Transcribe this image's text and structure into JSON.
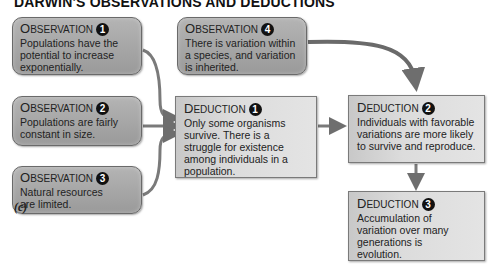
{
  "title": "DARWIN'S OBSERVATIONS AND DEDUCTIONS",
  "caption": "(c)",
  "observations": [
    {
      "label_first": "O",
      "label_rest": "BSERVATION",
      "number": "1",
      "text": "Populations have the potential to increase exponentially."
    },
    {
      "label_first": "O",
      "label_rest": "BSERVATION",
      "number": "2",
      "text": "Populations are fairly constant in size."
    },
    {
      "label_first": "O",
      "label_rest": "BSERVATION",
      "number": "3",
      "text": "Natural resources are limited."
    },
    {
      "label_first": "O",
      "label_rest": "BSERVATION",
      "number": "4",
      "text": "There is variation within a species, and variation is inherited."
    }
  ],
  "deductions": [
    {
      "label_first": "D",
      "label_rest": "EDUCTION",
      "number": "1",
      "text": "Only some organisms survive. There is a struggle for existence among individuals in a population."
    },
    {
      "label_first": "D",
      "label_rest": "EDUCTION",
      "number": "2",
      "text": "Individuals with favorable variations are more likely to survive and reproduce."
    },
    {
      "label_first": "D",
      "label_rest": "EDUCTION",
      "number": "3",
      "text": "Accumulation of variation over many generations is evolution."
    }
  ],
  "colors": {
    "observation_box": "#a6a6a6",
    "deduction_box": "#dcdcdc",
    "arrow": "#6e6e6e"
  }
}
